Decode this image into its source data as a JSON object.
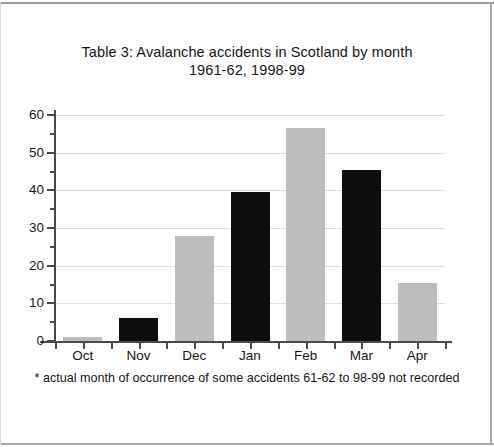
{
  "figure": {
    "title_line1": "Table 3: Avalanche accidents in Scotland by month",
    "title_line2": "1961-62, 1998-99",
    "footnote": "* actual month of occurrence of some accidents 61-62 to 98-99 not recorded"
  },
  "colors": {
    "bar_dark": "#0d0d0d",
    "bar_light": "#bdbdbd",
    "axis": "#4a4a4a",
    "grid": "#dedede",
    "text": "#161616",
    "page_frame": "#a8a8a8"
  },
  "chart_data": {
    "type": "bar",
    "title": "Table 3: Avalanche accidents in Scotland by month 1961-62, 1998-99",
    "xlabel": "",
    "ylabel": "",
    "categories": [
      "Oct",
      "Nov",
      "Dec",
      "Jan",
      "Feb",
      "Mar",
      "Apr"
    ],
    "values": [
      1,
      6,
      28,
      39.5,
      56.5,
      45.5,
      15.5
    ],
    "bar_colors": [
      "#bdbdbd",
      "#0d0d0d",
      "#bdbdbd",
      "#0d0d0d",
      "#bdbdbd",
      "#0d0d0d",
      "#bdbdbd"
    ],
    "ylim": [
      0,
      60
    ],
    "ytick_labels": [
      "0",
      "10",
      "20",
      "30",
      "40",
      "50",
      "60"
    ],
    "ytick_values": [
      0,
      10,
      20,
      30,
      40,
      50,
      60
    ],
    "yminor_values": [
      5,
      15,
      25,
      35,
      45,
      55
    ],
    "grid": "horizontal",
    "legend": "none",
    "annotations": [
      "* actual month of occurrence of some accidents 61-62 to 98-99 not recorded"
    ]
  }
}
